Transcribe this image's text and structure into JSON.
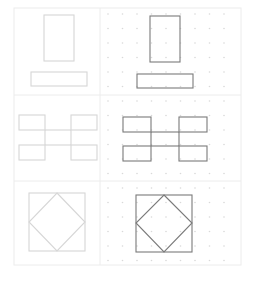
{
  "figure": {
    "width": 254,
    "height": 281,
    "grid": {
      "x0": 14,
      "y0": 8,
      "x1": 241,
      "y1": 265,
      "col_divider_x": 100,
      "row_dividers_y": [
        95,
        181
      ],
      "border_color": "#ececec"
    },
    "dot_grid": {
      "x_start": 108,
      "x_end": 238,
      "y_start": 14,
      "y_end": 262,
      "spacing": 14.5,
      "color": "#d9d9d9"
    },
    "colors": {
      "faded_stroke": "#d6d6d6",
      "dark_stroke": "#7a7a7a"
    },
    "panels": [
      {
        "name": "top-left-rect-and-bar",
        "style": "faded",
        "shapes": [
          {
            "type": "rect",
            "x": 44,
            "y": 15,
            "w": 30,
            "h": 46
          },
          {
            "type": "rect",
            "x": 31,
            "y": 72,
            "w": 56,
            "h": 14
          }
        ]
      },
      {
        "name": "top-right-rect-and-bar",
        "style": "dark",
        "shapes": [
          {
            "type": "rect",
            "x": 150,
            "y": 16,
            "w": 30,
            "h": 46
          },
          {
            "type": "rect",
            "x": 137,
            "y": 74,
            "w": 56,
            "h": 14
          }
        ]
      },
      {
        "name": "middle-left-h-shape",
        "style": "faded",
        "shapes": [
          {
            "type": "rect",
            "x": 19,
            "y": 115,
            "w": 26,
            "h": 15
          },
          {
            "type": "rect",
            "x": 71,
            "y": 115,
            "w": 26,
            "h": 15
          },
          {
            "type": "rect",
            "x": 19,
            "y": 145,
            "w": 26,
            "h": 15
          },
          {
            "type": "rect",
            "x": 71,
            "y": 145,
            "w": 26,
            "h": 15
          },
          {
            "type": "line",
            "x1": 45,
            "y1": 130,
            "x2": 71,
            "y2": 130
          },
          {
            "type": "line",
            "x1": 45,
            "y1": 145,
            "x2": 71,
            "y2": 145
          },
          {
            "type": "line",
            "x1": 45,
            "y1": 130,
            "x2": 45,
            "y2": 145
          },
          {
            "type": "line",
            "x1": 71,
            "y1": 130,
            "x2": 71,
            "y2": 145
          }
        ]
      },
      {
        "name": "middle-right-h-shape",
        "style": "dark",
        "shapes": [
          {
            "type": "rect",
            "x": 123,
            "y": 117,
            "w": 28,
            "h": 15
          },
          {
            "type": "rect",
            "x": 179,
            "y": 117,
            "w": 28,
            "h": 15
          },
          {
            "type": "rect",
            "x": 123,
            "y": 146,
            "w": 28,
            "h": 15
          },
          {
            "type": "rect",
            "x": 179,
            "y": 146,
            "w": 28,
            "h": 15
          },
          {
            "type": "line",
            "x1": 151,
            "y1": 132,
            "x2": 179,
            "y2": 132
          },
          {
            "type": "line",
            "x1": 151,
            "y1": 146,
            "x2": 179,
            "y2": 146
          },
          {
            "type": "line",
            "x1": 151,
            "y1": 132,
            "x2": 151,
            "y2": 146
          },
          {
            "type": "line",
            "x1": 179,
            "y1": 132,
            "x2": 179,
            "y2": 146
          }
        ]
      },
      {
        "name": "bottom-left-square-diamond",
        "style": "faded",
        "shapes": [
          {
            "type": "rect",
            "x": 29,
            "y": 193,
            "w": 56,
            "h": 58
          },
          {
            "type": "polygon",
            "points": "57,193 85,222 57,251 29,222"
          }
        ]
      },
      {
        "name": "bottom-right-square-diamond",
        "style": "dark",
        "shapes": [
          {
            "type": "rect",
            "x": 136,
            "y": 195,
            "w": 56,
            "h": 57
          },
          {
            "type": "polygon",
            "points": "164,195 192,223 164,252 136,223"
          }
        ]
      }
    ]
  }
}
